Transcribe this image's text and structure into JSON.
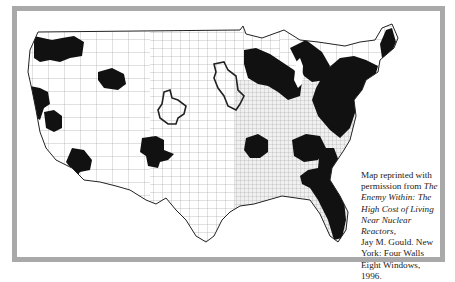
{
  "figure": {
    "type": "county-level choropleth map of the continental United States",
    "colors": {
      "frame": "#a9a9a9",
      "background": "#ffffff",
      "county_lines": "#8a8a8a",
      "dense_county_fill": "#e2e2e2",
      "highlighted_regions": "#111111",
      "outlined_regions": "#222222"
    },
    "highlighted_region_labels": [
      "Pacific Northwest (WA/OR)",
      "Northern California coast",
      "San Francisco Bay area",
      "Southern California",
      "Idaho / southern Idaho",
      "Central Arizona",
      "Colorado / Northern New Mexico",
      "Central Missouri / Kansas border",
      "Upper Midwest / Great Lakes (MN, WI, MI, IL)",
      "Northeast / Mid-Atlantic corridor",
      "Tennessee / Alabama",
      "Southeast (GA, SC, FL)"
    ],
    "outlined_region_labels": [
      "Colorado region",
      "Iowa / eastern Nebraska region"
    ]
  },
  "caption": {
    "line1": "Map reprinted with",
    "line2_prefix": "permission from ",
    "title_italic_1": "The",
    "title_italic_2": "Enemy Within: The",
    "title_italic_3": "High Cost of Living",
    "title_italic_4": "Near Nuclear Reactors,",
    "author": "Jay M. Gould. New",
    "publisher_1": "York: Four Walls",
    "publisher_2": "Eight Windows, 1996."
  }
}
